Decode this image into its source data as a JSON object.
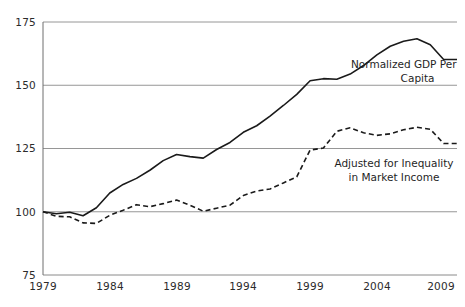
{
  "chart_data": {
    "type": "line",
    "title": "",
    "subtitle": "",
    "xlabel": "",
    "ylabel": "",
    "xlim": [
      1979,
      2010
    ],
    "ylim": [
      75,
      175
    ],
    "xticks": [
      1979,
      1984,
      1989,
      1994,
      1999,
      2004,
      2009
    ],
    "yticks": [
      75,
      100,
      125,
      150,
      175
    ],
    "grid": "horizontal",
    "legend_position": "inline-annotations",
    "x": [
      1979,
      1980,
      1981,
      1982,
      1983,
      1984,
      1985,
      1986,
      1987,
      1988,
      1989,
      1990,
      1991,
      1992,
      1993,
      1994,
      1995,
      1996,
      1997,
      1998,
      1999,
      2000,
      2001,
      2002,
      2003,
      2004,
      2005,
      2006,
      2007,
      2008,
      2009,
      2010
    ],
    "series": [
      {
        "name": "Normalized GDP Per Capita",
        "style": "solid",
        "color": "#1a1a1a",
        "values": [
          100,
          99.2,
          99.8,
          98.4,
          101.6,
          107.4,
          110.8,
          113.2,
          116.4,
          120.2,
          122.6,
          121.8,
          121.2,
          124.6,
          127.4,
          131.4,
          134.0,
          137.8,
          142.0,
          146.4,
          151.8,
          152.6,
          152.4,
          154.4,
          157.8,
          162.0,
          165.4,
          167.4,
          168.4,
          166.0,
          160.2,
          160.2
        ]
      },
      {
        "name": "Adjusted for Inequality in Market Income",
        "style": "dashed",
        "color": "#1a1a1a",
        "values": [
          100,
          98.2,
          98.0,
          95.6,
          95.4,
          98.6,
          100.6,
          102.8,
          102.0,
          103.2,
          104.6,
          102.6,
          100.2,
          101.4,
          102.6,
          106.4,
          108.2,
          109.0,
          111.4,
          113.8,
          124.4,
          125.2,
          131.8,
          133.2,
          131.2,
          130.2,
          130.8,
          132.4,
          133.4,
          132.6,
          127.0,
          127.0
        ]
      }
    ],
    "annotations": [
      {
        "id": "gdp-annotation",
        "line1": "Normalized GDP Per",
        "line2": "Capita"
      },
      {
        "id": "inequality-annotation",
        "line1": "Adjusted for Inequality",
        "line2": "in Market Income"
      }
    ],
    "colors": {
      "axis": "#6f6f6f",
      "gridline": "#8a8a8a",
      "series": "#1a1a1a",
      "background": "#ffffff",
      "text": "#2b2b2b"
    }
  }
}
